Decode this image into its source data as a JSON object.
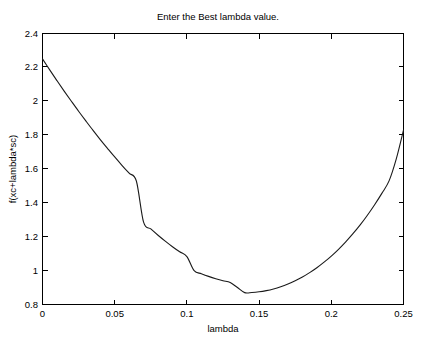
{
  "window": {
    "background_color": "#ffffff",
    "width": 427,
    "height": 351
  },
  "chart_data": {
    "type": "line",
    "title": "Enter the Best lambda value.",
    "xlabel": "lambda",
    "ylabel": "f(xc+lambda*sc)",
    "xlim": [
      0,
      0.25
    ],
    "ylim": [
      0.8,
      2.4
    ],
    "xticks": [
      0,
      0.05,
      0.1,
      0.15,
      0.2,
      0.25
    ],
    "xtick_labels": [
      "0",
      "0.05",
      "0.1",
      "0.15",
      "0.2",
      "0.25"
    ],
    "yticks": [
      0.8,
      1.0,
      1.2,
      1.4,
      1.6,
      1.8,
      2.0,
      2.2,
      2.4
    ],
    "ytick_labels": [
      "0.8",
      "1",
      "1.2",
      "1.4",
      "1.6",
      "1.8",
      "2",
      "2.2",
      "2.4"
    ],
    "grid": false,
    "legend": null,
    "box": true,
    "tick_direction": "in",
    "line_color": "#1a1a1a",
    "series": [
      {
        "name": "f(xc+lambda*sc)",
        "x": [
          0,
          0.005,
          0.01,
          0.015,
          0.02,
          0.025,
          0.03,
          0.035,
          0.04,
          0.045,
          0.05,
          0.055,
          0.06,
          0.065,
          0.07,
          0.075,
          0.08,
          0.085,
          0.09,
          0.095,
          0.1,
          0.105,
          0.11,
          0.115,
          0.12,
          0.125,
          0.13,
          0.135,
          0.14,
          0.145,
          0.15,
          0.155,
          0.16,
          0.165,
          0.17,
          0.175,
          0.18,
          0.185,
          0.19,
          0.195,
          0.2,
          0.205,
          0.21,
          0.215,
          0.22,
          0.225,
          0.23,
          0.235,
          0.24,
          0.245,
          0.25
        ],
        "y": [
          2.25,
          2.185,
          2.122,
          2.06,
          2.0,
          1.941,
          1.884,
          1.828,
          1.774,
          1.722,
          1.671,
          1.622,
          1.575,
          1.529,
          1.286,
          1.246,
          1.209,
          1.174,
          1.141,
          1.111,
          1.083,
          1.0,
          0.982,
          0.966,
          0.952,
          0.94,
          0.93,
          0.9,
          0.87,
          0.871,
          0.875,
          0.882,
          0.892,
          0.905,
          0.921,
          0.94,
          0.962,
          0.988,
          1.017,
          1.05,
          1.086,
          1.126,
          1.17,
          1.218,
          1.27,
          1.327,
          1.389,
          1.456,
          1.53,
          1.66,
          1.83
        ]
      }
    ],
    "min_point": {
      "x": 0.14,
      "y": 0.87
    },
    "start_point": {
      "x": 0,
      "y": 2.25
    },
    "end_point": {
      "x": 0.25,
      "y": 1.83
    }
  }
}
